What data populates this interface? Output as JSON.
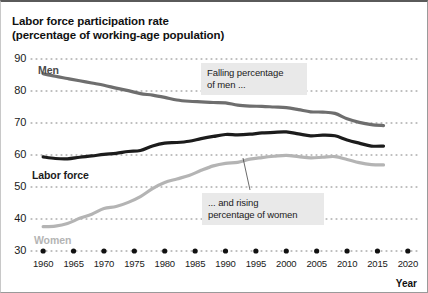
{
  "title": {
    "line1": "Labor force participation rate",
    "line2": "(percentage of working-age population)"
  },
  "axis": {
    "x_label": "Year",
    "y_ticks": [
      "90",
      "80",
      "70",
      "60",
      "50",
      "40",
      "30"
    ],
    "x_ticks": [
      "1960",
      "1965",
      "1970",
      "1975",
      "1980",
      "1985",
      "1990",
      "1995",
      "2000",
      "2005",
      "2010",
      "2015",
      "2020"
    ]
  },
  "series_labels": {
    "men": "Men",
    "labor_force": "Labor force",
    "women": "Women"
  },
  "annotations": {
    "men_note": "Falling percentage\nof men ...",
    "women_note": "... and rising\npercentage of women"
  },
  "colors": {
    "men": "#6e6e6e",
    "labor_force": "#1c1c1c",
    "women": "#b4b4b4",
    "grid": "#808080",
    "annotation_bg": "#e9e9e9",
    "text": "#1a1a1a"
  },
  "chart_data": {
    "type": "line",
    "title": "Labor force participation rate (percentage of working-age population)",
    "xlabel": "Year",
    "ylabel": "Labor force participation rate (percentage of working-age population)",
    "xlim": [
      1958,
      2022
    ],
    "ylim": [
      30,
      90
    ],
    "grid": true,
    "grid_style": "dotted-horizontal",
    "legend": "inline-labels",
    "x": [
      1960,
      1962,
      1964,
      1966,
      1968,
      1970,
      1972,
      1974,
      1976,
      1978,
      1980,
      1982,
      1984,
      1986,
      1988,
      1990,
      1992,
      1994,
      1996,
      1998,
      2000,
      2002,
      2004,
      2006,
      2008,
      2010,
      2012,
      2014,
      2016
    ],
    "series": [
      {
        "name": "Men",
        "color": "#6e6e6e",
        "values": [
          85.4,
          84.6,
          83.9,
          83.2,
          82.5,
          81.8,
          80.9,
          80.1,
          79.2,
          78.7,
          78.0,
          77.2,
          76.8,
          76.6,
          76.4,
          76.3,
          75.6,
          75.3,
          75.2,
          75.0,
          74.8,
          74.2,
          73.5,
          73.4,
          73.0,
          71.3,
          70.2,
          69.5,
          69.2
        ]
      },
      {
        "name": "Labor force",
        "color": "#1c1c1c",
        "values": [
          59.4,
          58.9,
          58.8,
          59.3,
          59.7,
          60.2,
          60.5,
          61.1,
          61.4,
          62.8,
          63.7,
          63.9,
          64.3,
          65.1,
          65.8,
          66.4,
          66.3,
          66.5,
          66.9,
          67.1,
          67.2,
          66.6,
          66.0,
          66.2,
          66.0,
          64.7,
          63.7,
          62.8,
          62.8
        ]
      },
      {
        "name": "Women",
        "color": "#b4b4b4",
        "values": [
          37.6,
          37.8,
          38.6,
          40.2,
          41.5,
          43.3,
          43.9,
          45.2,
          47.0,
          49.5,
          51.4,
          52.5,
          53.6,
          55.2,
          56.6,
          57.4,
          57.7,
          58.7,
          59.2,
          59.6,
          59.9,
          59.5,
          59.1,
          59.3,
          59.5,
          58.6,
          57.6,
          57.0,
          56.9
        ]
      }
    ],
    "annotations": [
      {
        "text": "Falling percentage of men ...",
        "points_to_series": "Men",
        "points_to_x": 1991
      },
      {
        "text": "... and rising percentage of women",
        "points_to_series": "Women",
        "points_to_x": 1994
      }
    ]
  }
}
